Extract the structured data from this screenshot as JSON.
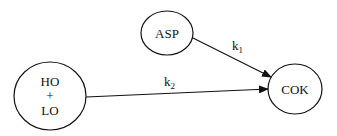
{
  "diagram": {
    "type": "reaction-scheme",
    "nodes": [
      {
        "id": "asp",
        "label": "ASP"
      },
      {
        "id": "holo",
        "lines": [
          "HO",
          "+",
          "LO"
        ]
      },
      {
        "id": "cok",
        "label": "COK"
      }
    ],
    "edges": [
      {
        "from": "asp",
        "to": "cok",
        "label": "k",
        "sub": "1"
      },
      {
        "from": "holo",
        "to": "cok",
        "label": "k",
        "sub": "2"
      }
    ]
  },
  "colors": {
    "stroke": "#111111",
    "background": "#ffffff"
  }
}
